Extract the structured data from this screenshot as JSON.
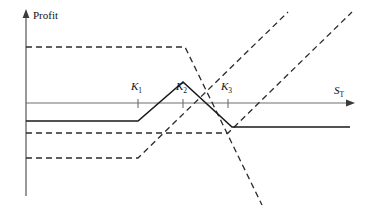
{
  "chart_data": {
    "type": "line",
    "title": "",
    "xlabel": "S_T",
    "ylabel": "Profit",
    "grid": false,
    "legend": null,
    "axes": {
      "y_axis_label": "Profit",
      "x_axis_label": "S",
      "x_axis_label_sub": "T",
      "origin_px": [
        26,
        103
      ],
      "x_axis_y_px": 103,
      "y_axis_x_px": 26,
      "x_axis_end_px": 350,
      "y_axis_top_px": 12
    },
    "strike_ticks": [
      {
        "name": "K",
        "sub": "1",
        "label": "K₁",
        "x_px": 138
      },
      {
        "name": "K",
        "sub": "2",
        "label": "K₂",
        "x_px": 183
      },
      {
        "name": "K",
        "sub": "3",
        "label": "K₃",
        "x_px": 228
      }
    ],
    "series": [
      {
        "name": "butterfly-spread-total-profit",
        "style": "solid",
        "color": "#1a1a1a",
        "width": 1.6,
        "points_px": [
          [
            26,
            121
          ],
          [
            138,
            121
          ],
          [
            183,
            82
          ],
          [
            232,
            127
          ],
          [
            350,
            127
          ]
        ]
      },
      {
        "name": "long-call-low-strike-profit",
        "style": "dashed",
        "color": "#2b2b2b",
        "width": 1.3,
        "points_px": [
          [
            26,
            158
          ],
          [
            138,
            158
          ],
          [
            288,
            12
          ]
        ]
      },
      {
        "name": "long-call-high-strike-profit",
        "style": "dashed",
        "color": "#2b2b2b",
        "width": 1.3,
        "points_px": [
          [
            26,
            133
          ],
          [
            228,
            133
          ],
          [
            352,
            12
          ]
        ]
      },
      {
        "name": "short-calls-middle-strike-profit",
        "style": "dashed",
        "color": "#2b2b2b",
        "width": 1.3,
        "points_px": [
          [
            26,
            47
          ],
          [
            185,
            47
          ],
          [
            262,
            205
          ]
        ]
      }
    ],
    "notes": {
      "zero_profit_line": 103,
      "peak_profit_px": [
        183,
        82
      ],
      "trough_px": [
        232,
        127
      ]
    }
  },
  "labels": {
    "profit": "Profit",
    "st_main": "S",
    "st_sub": "T",
    "k1_main": "K",
    "k1_sub": "1",
    "k2_main": "K",
    "k2_sub": "2",
    "k3_main": "K",
    "k3_sub": "3"
  }
}
